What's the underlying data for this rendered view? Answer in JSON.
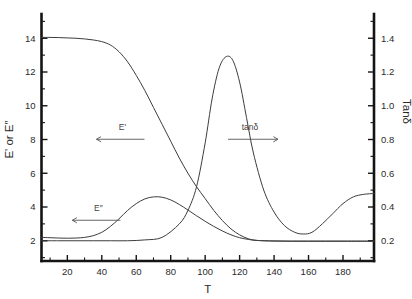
{
  "chart_data": {
    "type": "line",
    "title": "",
    "subtitle": "",
    "xlabel": "T",
    "ylabel": "E' or E″",
    "y2label": "Tanδ",
    "xlim": [
      5,
      198
    ],
    "ylim": [
      0.8,
      15.2
    ],
    "y2lim": [
      0.08,
      1.52
    ],
    "grid": false,
    "legend": "none",
    "xticks": [
      20,
      40,
      60,
      80,
      100,
      120,
      140,
      160,
      180
    ],
    "xticklabels": [
      "20",
      "40",
      "60",
      "80",
      "100",
      "120",
      "140",
      "160",
      "180"
    ],
    "xminorticks": [
      10,
      30,
      50,
      70,
      90,
      110,
      130,
      150,
      170,
      190
    ],
    "yticks": [
      2,
      4,
      6,
      8,
      10,
      12,
      14
    ],
    "yticklabels": [
      "2",
      "4",
      "6",
      "8",
      "10",
      "12",
      "14"
    ],
    "yminorticks": [
      1,
      3,
      5,
      7,
      9,
      11,
      13,
      15
    ],
    "y2ticks": [
      0.2,
      0.4,
      0.6,
      0.8,
      1.0,
      1.2,
      1.4
    ],
    "y2ticklabels": [
      "0.2",
      "0.4",
      "0.6",
      "0.8",
      "1.0",
      "1.2",
      "1.4"
    ],
    "y2minorticks": [
      0.1,
      0.3,
      0.5,
      0.7,
      0.9,
      1.1,
      1.3,
      1.5
    ],
    "series": [
      {
        "name": "E'",
        "axis": "left",
        "x": [
          5,
          10,
          15,
          20,
          25,
          30,
          35,
          40,
          45,
          50,
          55,
          60,
          65,
          70,
          75,
          80,
          85,
          90,
          95,
          100,
          105,
          110,
          115,
          120,
          125,
          130,
          140,
          150,
          160,
          170,
          180,
          190,
          198
        ],
        "y": [
          14.05,
          14.05,
          14.04,
          14.02,
          14.0,
          13.96,
          13.9,
          13.8,
          13.6,
          13.2,
          12.6,
          11.8,
          10.9,
          9.9,
          8.9,
          7.9,
          6.9,
          6.0,
          5.2,
          4.5,
          3.8,
          3.2,
          2.7,
          2.35,
          2.12,
          2.02,
          1.98,
          1.97,
          1.97,
          1.97,
          1.97,
          1.97,
          1.97
        ]
      },
      {
        "name": "E″",
        "axis": "left",
        "x": [
          5,
          10,
          15,
          20,
          25,
          30,
          35,
          40,
          45,
          50,
          55,
          60,
          65,
          70,
          75,
          80,
          85,
          90,
          95,
          100,
          105,
          110,
          115,
          120,
          125,
          130,
          140,
          150,
          160,
          170,
          180,
          190,
          198
        ],
        "y": [
          2.2,
          2.18,
          2.16,
          2.15,
          2.16,
          2.2,
          2.3,
          2.5,
          2.85,
          3.3,
          3.8,
          4.2,
          4.48,
          4.6,
          4.58,
          4.42,
          4.15,
          3.82,
          3.48,
          3.15,
          2.85,
          2.58,
          2.35,
          2.18,
          2.08,
          2.02,
          1.99,
          1.98,
          1.98,
          1.98,
          1.98,
          1.98,
          1.98
        ]
      },
      {
        "name": "tanδ",
        "axis": "right",
        "x": [
          5,
          15,
          25,
          35,
          45,
          55,
          65,
          75,
          85,
          90,
          95,
          100,
          104,
          108,
          112,
          116,
          120,
          124,
          128,
          134,
          140,
          146,
          152,
          157,
          162,
          168,
          174,
          180,
          186,
          192,
          198
        ],
        "y": [
          0.2,
          0.2,
          0.2,
          0.2,
          0.2,
          0.2,
          0.205,
          0.22,
          0.3,
          0.38,
          0.52,
          0.78,
          1.04,
          1.22,
          1.29,
          1.27,
          1.14,
          0.93,
          0.72,
          0.5,
          0.37,
          0.29,
          0.25,
          0.24,
          0.25,
          0.3,
          0.36,
          0.42,
          0.46,
          0.475,
          0.48
        ]
      }
    ],
    "annotations": [
      {
        "id": "annot-e-prime",
        "text": "E'",
        "x": 52,
        "y": 8.4,
        "arrow_direction": "left",
        "points_to": "left-axis"
      },
      {
        "id": "annot-e-double-prime",
        "text": "E″",
        "x": 38,
        "y": 3.6,
        "arrow_direction": "left",
        "points_to": "left-axis"
      },
      {
        "id": "annot-tan-delta",
        "text": "tanδ",
        "x": 126,
        "y": 0.84,
        "arrow_direction": "right",
        "points_to": "right-axis"
      }
    ],
    "peaks": {
      "e_double_prime_peak": {
        "x": 70,
        "y": 4.6
      },
      "tan_delta_peak": {
        "x": 112,
        "y": 1.29
      },
      "tan_delta_valley": {
        "x": 157,
        "y": 0.24
      }
    },
    "colors": {
      "background": "#ffffff",
      "axis": "#141414",
      "curve": "#3d3d3d",
      "text": "#2b2b2b",
      "annotation": "#555555"
    }
  }
}
